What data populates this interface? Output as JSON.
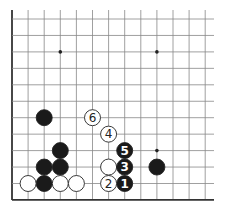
{
  "board": {
    "origin_x": 12,
    "origin_y": 19,
    "spacing_x": 16.1,
    "spacing_y": 16.45,
    "columns": 13,
    "rows": 12,
    "top_extent": 10,
    "right_extent": 214,
    "left_edge": true,
    "bottom_edge": true,
    "line_color": "#888888",
    "edge_color": "#333333",
    "stone_radius": 8
  },
  "star_points": [
    {
      "col": 3,
      "row": 2
    },
    {
      "col": 9,
      "row": 2
    },
    {
      "col": 9,
      "row": 8
    }
  ],
  "stones": [
    {
      "col": 2,
      "row": 6,
      "color": "black",
      "label": ""
    },
    {
      "col": 3,
      "row": 8,
      "color": "black",
      "label": ""
    },
    {
      "col": 2,
      "row": 9,
      "color": "black",
      "label": ""
    },
    {
      "col": 3,
      "row": 9,
      "color": "black",
      "label": ""
    },
    {
      "col": 2,
      "row": 10,
      "color": "black",
      "label": ""
    },
    {
      "col": 9,
      "row": 9,
      "color": "black",
      "label": ""
    },
    {
      "col": 1,
      "row": 10,
      "color": "white",
      "label": ""
    },
    {
      "col": 3,
      "row": 10,
      "color": "white",
      "label": ""
    },
    {
      "col": 4,
      "row": 10,
      "color": "white",
      "label": ""
    },
    {
      "col": 6,
      "row": 9,
      "color": "white",
      "label": ""
    },
    {
      "col": 7,
      "row": 10,
      "color": "black",
      "label": "1"
    },
    {
      "col": 6,
      "row": 10,
      "color": "white",
      "label": "2"
    },
    {
      "col": 7,
      "row": 9,
      "color": "black",
      "label": "3"
    },
    {
      "col": 6,
      "row": 7,
      "color": "white",
      "label": "4"
    },
    {
      "col": 7,
      "row": 8,
      "color": "black",
      "label": "5"
    },
    {
      "col": 5,
      "row": 6,
      "color": "white",
      "label": "6"
    }
  ]
}
